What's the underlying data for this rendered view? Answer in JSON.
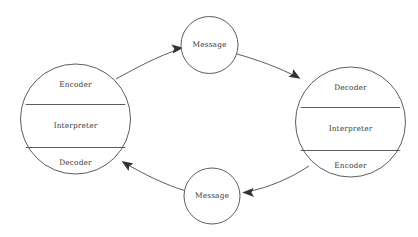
{
  "diagram": {
    "background_color": "#ffffff",
    "stroke_color": "#4a4a4a",
    "text_color": "#3a3a3a",
    "nodes": {
      "sender": {
        "name": "sender-circle",
        "segments": [
          {
            "label": "Encoder"
          },
          {
            "label": "Interpreter"
          },
          {
            "label": "Decoder"
          }
        ]
      },
      "receiver": {
        "name": "receiver-circle",
        "segments": [
          {
            "label": "Decoder"
          },
          {
            "label": "Interpreter"
          },
          {
            "label": "Encoder"
          }
        ]
      },
      "message_top": {
        "label": "Message"
      },
      "message_bottom": {
        "label": "Message"
      }
    },
    "connectors": [
      {
        "name": "sender-to-message-top",
        "from": "sender",
        "to": "message_top",
        "arrow": "true"
      },
      {
        "name": "message-top-to-receiver",
        "from": "message_top",
        "to": "receiver",
        "arrow": "true"
      },
      {
        "name": "receiver-to-message-bottom",
        "from": "receiver",
        "to": "message_bottom",
        "arrow": "true"
      },
      {
        "name": "message-bottom-to-sender",
        "from": "message_bottom",
        "to": "sender",
        "arrow": "true"
      }
    ]
  }
}
